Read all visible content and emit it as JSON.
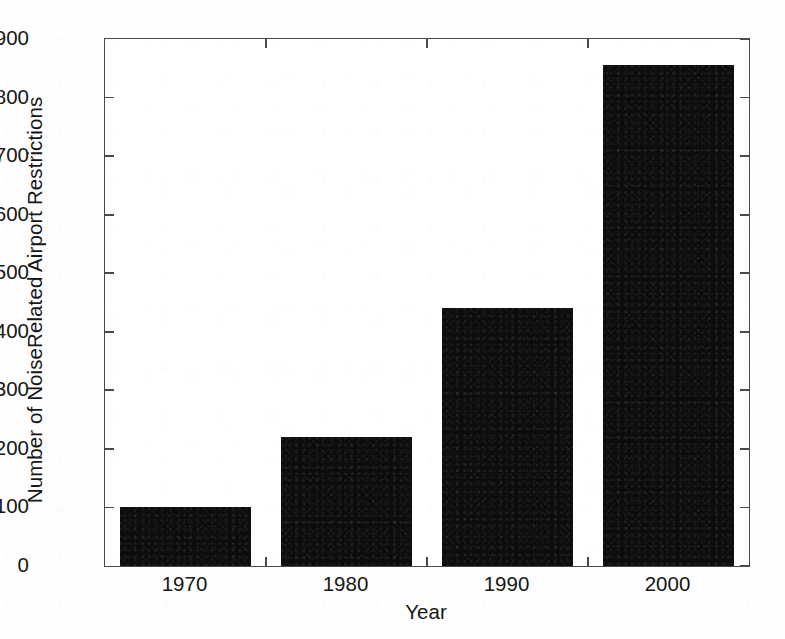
{
  "chart_data": {
    "type": "bar",
    "title": "",
    "subtitle": "",
    "xlabel": "Year",
    "ylabel": "Number of NoiseRelated Airport Restrictions",
    "categories": [
      "1970",
      "1980",
      "1990",
      "2000"
    ],
    "values": [
      100,
      220,
      440,
      856
    ],
    "series": [
      {
        "name": "Noise-Related Airport Restrictions",
        "values": [
          100,
          220,
          440,
          856
        ]
      }
    ],
    "ylim": [
      0,
      900
    ],
    "ytick_labels": [
      "0",
      "100",
      "200",
      "300",
      "400",
      "500",
      "600",
      "700",
      "800",
      "900"
    ],
    "ytick_values": [
      0,
      100,
      200,
      300,
      400,
      500,
      600,
      700,
      800,
      900
    ],
    "xtick_labels": [
      "1970",
      "1980",
      "1990",
      "2000"
    ],
    "grid": false,
    "legend": false,
    "legend_position": "none",
    "bar_color": "#0d0d0d",
    "axis_color": "#4a4a4a",
    "background_color": "#ffffff",
    "annotations": []
  },
  "figure": {
    "axis_label_x": "Year",
    "axis_label_y": "Number of NoiseRelated Airport Restrictions"
  }
}
